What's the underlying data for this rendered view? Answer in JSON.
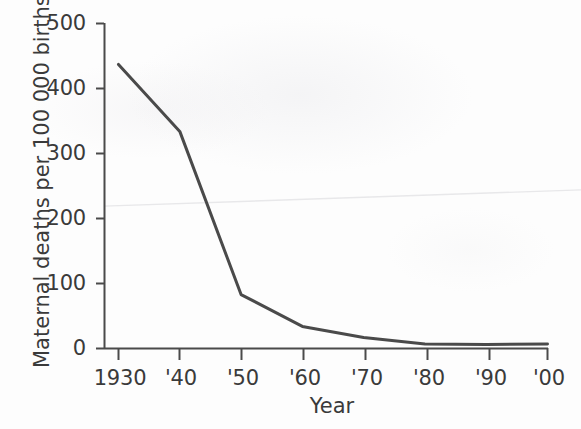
{
  "chart_data": {
    "type": "line",
    "title": "",
    "xlabel": "Year",
    "ylabel": "Maternal deaths per 100 000 births",
    "x": [
      1930,
      1940,
      1950,
      1960,
      1970,
      1980,
      1990,
      2000
    ],
    "xtick_labels": [
      "1930",
      "'40",
      "'50",
      "'60",
      "'70",
      "'80",
      "'90",
      "'00"
    ],
    "ytick_labels": [
      "0",
      "100",
      "200",
      "300",
      "400",
      "500"
    ],
    "ytick_values": [
      0,
      100,
      200,
      300,
      400,
      500
    ],
    "xlim": [
      1930,
      2000
    ],
    "ylim": [
      0,
      500
    ],
    "grid": false,
    "legend": null,
    "series": [
      {
        "name": "Maternal deaths per 100 000 births",
        "color": "#4a4a4a",
        "line_width": 3,
        "values": [
          437,
          334,
          83,
          34,
          17,
          7,
          6,
          7
        ]
      }
    ],
    "annotations": [
      {
        "name": "scan-artifact-line",
        "kind": "faint-diagonal-crease",
        "color": "#e8e8ea",
        "from": [
          1930,
          219
        ],
        "to": [
          2000,
          244
        ]
      }
    ]
  },
  "axes": {
    "y_title": "Maternal deaths per 100 000 births",
    "x_title": "Year",
    "y_ticks": [
      {
        "label": "500",
        "value": 500
      },
      {
        "label": "400",
        "value": 400
      },
      {
        "label": "300",
        "value": 300
      },
      {
        "label": "200",
        "value": 200
      },
      {
        "label": "100",
        "value": 100
      },
      {
        "label": "0",
        "value": 0
      }
    ],
    "x_ticks": [
      {
        "label": "1930",
        "value": 1930
      },
      {
        "label": "'40",
        "value": 1940
      },
      {
        "label": "'50",
        "value": 1950
      },
      {
        "label": "'60",
        "value": 1960
      },
      {
        "label": "'70",
        "value": 1970
      },
      {
        "label": "'80",
        "value": 1980
      },
      {
        "label": "'90",
        "value": 1990
      },
      {
        "label": "'00",
        "value": 2000
      }
    ]
  },
  "colors": {
    "data_line": "#4a4a4a",
    "axis": "#4a4a4a",
    "text": "#3a3a3a",
    "background": "#fdfdfd",
    "artifact": "#e9e9eb"
  }
}
